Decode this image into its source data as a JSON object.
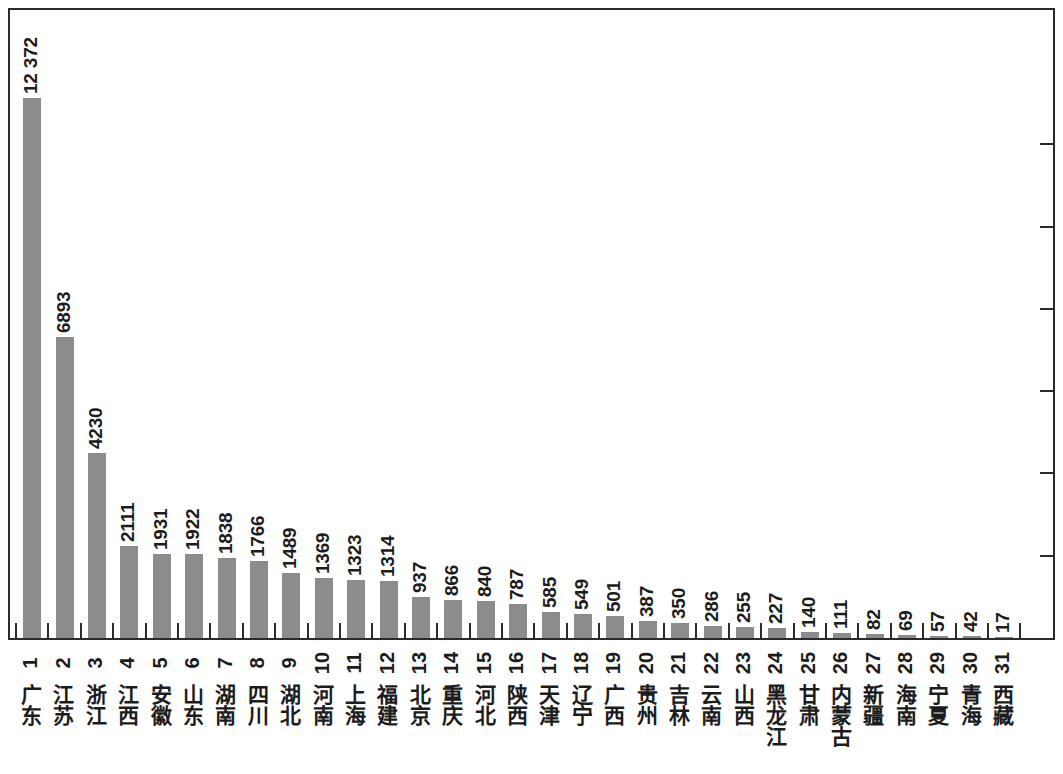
{
  "chart_data": {
    "type": "bar",
    "title": "",
    "subtitle": "",
    "xlabel": "",
    "ylabel": "",
    "grid": false,
    "legend": null,
    "orientation": "vertical",
    "value_label_position": "above-bar",
    "value_label_rotation": "90deg-ccw",
    "bar_color": "#8c8c8c",
    "axis_color": "#2b2b2b",
    "text_color": "#1c1c1c",
    "background": "#ffffff",
    "ylim": [
      0,
      13200
    ],
    "y_tick_count_right_axis": 6,
    "x_tick_style": "inside-between-bars",
    "categories": [
      "广东",
      "江苏",
      "浙江",
      "江西",
      "安徽",
      "山东",
      "湖南",
      "四川",
      "湖北",
      "河南",
      "上海",
      "福建",
      "北京",
      "重庆",
      "河北",
      "陕西",
      "天津",
      "辽宁",
      "广西",
      "贵州",
      "吉林",
      "云南",
      "山西",
      "黑龙江",
      "甘肃",
      "内蒙古",
      "新疆",
      "海南",
      "宁夏",
      "青海",
      "西藏"
    ],
    "ranks": [
      "1",
      "2",
      "3",
      "4",
      "5",
      "6",
      "7",
      "8",
      "9",
      "10",
      "11",
      "12",
      "13",
      "14",
      "15",
      "16",
      "17",
      "18",
      "19",
      "20",
      "21",
      "22",
      "23",
      "24",
      "25",
      "26",
      "27",
      "28",
      "29",
      "30",
      "31"
    ],
    "values": [
      12372,
      6893,
      4230,
      2111,
      1931,
      1922,
      1838,
      1766,
      1489,
      1369,
      1323,
      1314,
      937,
      866,
      840,
      787,
      585,
      549,
      501,
      387,
      350,
      286,
      255,
      227,
      140,
      111,
      82,
      69,
      57,
      42,
      17
    ],
    "value_labels": [
      "12 372",
      "6893",
      "4230",
      "2111",
      "1931",
      "1922",
      "1838",
      "1766",
      "1489",
      "1369",
      "1323",
      "1314",
      "937",
      "866",
      "840",
      "787",
      "585",
      "549",
      "501",
      "387",
      "350",
      "286",
      "255",
      "227",
      "140",
      "111",
      "82",
      "69",
      "57",
      "42",
      "17"
    ]
  }
}
